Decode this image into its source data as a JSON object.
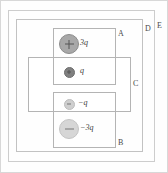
{
  "figure": {
    "type": "physics-diagram",
    "background_color": "#fefefe"
  },
  "surfaces": [
    {
      "id": "A",
      "label": "A",
      "label_x": 118,
      "label_y": 30,
      "x": 53,
      "y": 28,
      "w": 63,
      "h": 57,
      "stroke": "#b4b4b4"
    },
    {
      "id": "B",
      "label": "B",
      "label_x": 118,
      "label_y": 139,
      "x": 53,
      "y": 92,
      "w": 63,
      "h": 56,
      "stroke": "#b4b4b4"
    },
    {
      "id": "C",
      "label": "C",
      "label_x": 133,
      "label_y": 80,
      "x": 28,
      "y": 57,
      "w": 103,
      "h": 55,
      "stroke": "#b4b4b4"
    },
    {
      "id": "D",
      "label": "D",
      "label_x": 145,
      "label_y": 25,
      "x": 16,
      "y": 19,
      "w": 127,
      "h": 133,
      "stroke": "#c2c2c2"
    },
    {
      "id": "E",
      "label": "E",
      "label_x": 157,
      "label_y": 22,
      "x": 8,
      "y": 10,
      "w": 147,
      "h": 152,
      "stroke": "#cdcdcd"
    }
  ],
  "charges": [
    {
      "id": "charge-3q",
      "label": "3q",
      "sign": "plus",
      "sign_glyph": "+",
      "value": 3,
      "cx": 68,
      "cy": 43,
      "r": 9,
      "fill": "#a8a8a8",
      "stroke": "#8c8c8c",
      "label_x": 80,
      "label_y": 39
    },
    {
      "id": "charge-q",
      "label": "q",
      "sign": "plus",
      "sign_glyph": "+",
      "value": 1,
      "cx": 68,
      "cy": 71,
      "r": 4.5,
      "fill": "#808080",
      "stroke": "#6e6e6e",
      "label_x": 80,
      "label_y": 67
    },
    {
      "id": "charge-neg-q",
      "label": "−q",
      "sign": "minus",
      "sign_glyph": "−",
      "value": -1,
      "cx": 68,
      "cy": 103,
      "r": 4.5,
      "fill": "#cfcfcf",
      "stroke": "#bdbdbd",
      "label_x": 78,
      "label_y": 99
    },
    {
      "id": "charge-neg-3q",
      "label": "−3q",
      "sign": "minus",
      "sign_glyph": "−",
      "value": -3,
      "cx": 68,
      "cy": 128,
      "r": 9,
      "fill": "#d6d6d6",
      "stroke": "#c4c4c4",
      "label_x": 80,
      "label_y": 124
    }
  ]
}
